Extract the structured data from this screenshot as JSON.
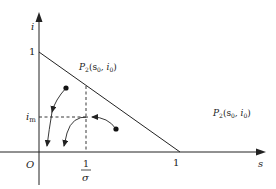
{
  "diagram": {
    "axes": {
      "y_label": "i",
      "x_label": "s",
      "origin_label": "O",
      "y_tick_label": "1",
      "x_tick_label": "1",
      "fraction_numerator": "1",
      "fraction_denominator": "σ",
      "im_label_main": "i",
      "im_label_sub": "m"
    },
    "points": [
      {
        "label_main": "P",
        "label_sub": "2",
        "label_args": "(s",
        "args_sub0": "0",
        "comma": ", i",
        "args_sub1": "0",
        "close": ")"
      },
      {
        "label_main": "P",
        "label_sub": "2",
        "label_args": "(s",
        "args_sub0": "0",
        "comma": ", i",
        "args_sub1": "0",
        "close": ")"
      }
    ],
    "colors": {
      "line": "#222222",
      "background": "#ffffff"
    }
  }
}
